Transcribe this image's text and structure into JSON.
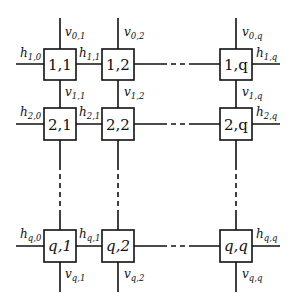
{
  "diagram": {
    "title": "",
    "nodes": [
      {
        "id": "1,1",
        "label": "1,1"
      },
      {
        "id": "1,2",
        "label": "1,2"
      },
      {
        "id": "1,q",
        "label": "1,q"
      },
      {
        "id": "2,1",
        "label": "2,1"
      },
      {
        "id": "2,2",
        "label": "2,2"
      },
      {
        "id": "2,q",
        "label": "2,q"
      },
      {
        "id": "q,1",
        "label": "q,1"
      },
      {
        "id": "q,2",
        "label": "q,2"
      },
      {
        "id": "q,q",
        "label": "q,q"
      }
    ],
    "edge_labels": {
      "v01": {
        "base": "v",
        "sub": "0,1"
      },
      "v02": {
        "base": "v",
        "sub": "0,2"
      },
      "v0q": {
        "base": "v",
        "sub": "0,q"
      },
      "h10": {
        "base": "h",
        "sub": "1,0"
      },
      "h11": {
        "base": "h",
        "sub": "1,1"
      },
      "h1q": {
        "base": "h",
        "sub": "1,q"
      },
      "v11": {
        "base": "v",
        "sub": "1,1"
      },
      "v12": {
        "base": "v",
        "sub": "1,2"
      },
      "v1q": {
        "base": "v",
        "sub": "1,q"
      },
      "h20": {
        "base": "h",
        "sub": "2,0"
      },
      "h21": {
        "base": "h",
        "sub": "2,1"
      },
      "h2q": {
        "base": "h",
        "sub": "2,q"
      },
      "hq0": {
        "base": "h",
        "sub": "q,0"
      },
      "hq1": {
        "base": "h",
        "sub": "q,1"
      },
      "hqq": {
        "base": "h",
        "sub": "q,q"
      },
      "vq1": {
        "base": "v",
        "sub": "q,1"
      },
      "vq2": {
        "base": "v",
        "sub": "q,2"
      },
      "vqq": {
        "base": "v",
        "sub": "q,q"
      }
    }
  }
}
